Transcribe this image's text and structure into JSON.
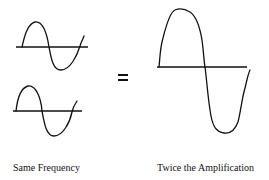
{
  "diagram": {
    "operator": "=",
    "waves": [
      {
        "id": "input-wave-1",
        "description": "sine wave, amplitude 1"
      },
      {
        "id": "input-wave-2",
        "description": "sine wave, amplitude 1"
      },
      {
        "id": "result-wave",
        "description": "sine wave, amplitude 2"
      }
    ],
    "labels": {
      "left": "Same Frequency",
      "right": "Twice the Amplification"
    },
    "colors": {
      "stroke": "#111111",
      "background": "#ffffff"
    }
  }
}
